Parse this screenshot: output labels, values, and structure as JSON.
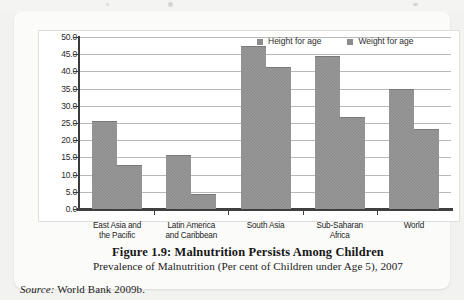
{
  "chart_data": {
    "type": "bar",
    "title": "Figure 1.9: Malnutrition Persists Among Children",
    "subtitle": "Prevalence of Malnutrition  (Per cent of Children under Age 5), 2007",
    "xlabel": "",
    "ylabel": "",
    "ylim": [
      0,
      50
    ],
    "ytick_step": 5,
    "grid": true,
    "legend_position": "top-right",
    "bar_color": "#8c8c8c",
    "categories": [
      "East Asia and the Pacific",
      "Latin America and Caribbean",
      "South Asia",
      "Sub-Saharan Africa",
      "World"
    ],
    "category_lines": [
      [
        "East Asia and",
        "the Pacific"
      ],
      [
        "Latin America",
        "and Caribbean"
      ],
      [
        "South Asia",
        ""
      ],
      [
        "Sub-Saharan",
        "Africa"
      ],
      [
        "World",
        ""
      ]
    ],
    "ticklabels": [
      "50.0",
      "45.0",
      "40.0",
      "35.0",
      "30.0",
      "25.0",
      "20.0",
      "15.0",
      "10.0",
      "5.0",
      "0.0"
    ],
    "series": [
      {
        "name": "Height for age",
        "values": [
          25.6,
          15.8,
          47.5,
          44.5,
          35.0
        ]
      },
      {
        "name": "Weight for age",
        "values": [
          12.7,
          4.5,
          41.3,
          26.8,
          23.3
        ]
      }
    ]
  },
  "source": {
    "label": "Source:",
    "text": "World Bank 2009b."
  }
}
